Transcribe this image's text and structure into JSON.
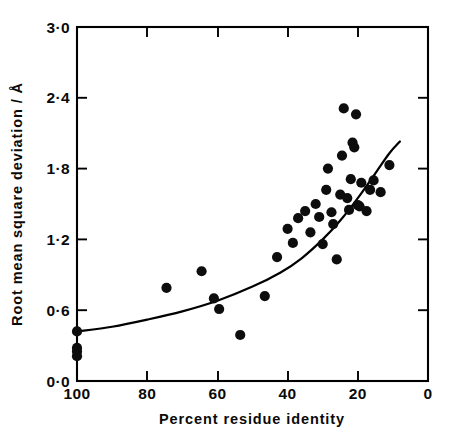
{
  "figure": {
    "background_color": "#ffffff",
    "ink_color": "#000000",
    "point_color": "#0d0d0d"
  },
  "chart_data": {
    "type": "scatter",
    "title": "",
    "xlabel": "Percent residue identity",
    "ylabel": "Root mean square deviation / Å",
    "xlim": [
      100,
      0
    ],
    "ylim": [
      0.0,
      3.0
    ],
    "x_reversed": true,
    "grid": false,
    "legend": null,
    "xticks": [
      100,
      80,
      60,
      40,
      20,
      0
    ],
    "xtick_labels": [
      "100",
      "80",
      "60",
      "40",
      "20",
      "0"
    ],
    "yticks": [
      0.0,
      0.6,
      1.2,
      1.8,
      2.4,
      3.0
    ],
    "ytick_labels": [
      "0·0",
      "0·6",
      "1·2",
      "1·8",
      "2·4",
      "3·0"
    ],
    "points": [
      [
        100.0,
        0.42
      ],
      [
        100.0,
        0.28
      ],
      [
        100.0,
        0.25
      ],
      [
        100.0,
        0.21
      ],
      [
        74.5,
        0.79
      ],
      [
        64.5,
        0.93
      ],
      [
        61.0,
        0.7
      ],
      [
        59.5,
        0.61
      ],
      [
        53.5,
        0.39
      ],
      [
        46.5,
        0.72
      ],
      [
        43.0,
        1.05
      ],
      [
        40.0,
        1.29
      ],
      [
        38.5,
        1.17
      ],
      [
        37.0,
        1.38
      ],
      [
        35.0,
        1.44
      ],
      [
        33.5,
        1.26
      ],
      [
        32.0,
        1.5
      ],
      [
        31.0,
        1.39
      ],
      [
        30.0,
        1.16
      ],
      [
        29.0,
        1.62
      ],
      [
        28.5,
        1.8
      ],
      [
        27.5,
        1.43
      ],
      [
        27.0,
        1.33
      ],
      [
        26.0,
        1.03
      ],
      [
        25.0,
        1.58
      ],
      [
        24.5,
        1.91
      ],
      [
        24.0,
        2.31
      ],
      [
        23.0,
        1.55
      ],
      [
        22.5,
        1.45
      ],
      [
        22.0,
        1.71
      ],
      [
        21.5,
        2.02
      ],
      [
        21.0,
        1.98
      ],
      [
        20.5,
        2.26
      ],
      [
        20.0,
        1.49
      ],
      [
        19.5,
        1.48
      ],
      [
        19.0,
        1.68
      ],
      [
        17.5,
        1.44
      ],
      [
        16.5,
        1.62
      ],
      [
        15.5,
        1.7
      ],
      [
        13.5,
        1.6
      ],
      [
        11.0,
        1.83
      ]
    ],
    "fit_curve": {
      "description": "smooth monotonic fitted trend line",
      "x": [
        100,
        90,
        80,
        70,
        60,
        50,
        42,
        36,
        30,
        25,
        20,
        15,
        11,
        8
      ],
      "y": [
        0.42,
        0.46,
        0.52,
        0.59,
        0.68,
        0.8,
        0.92,
        1.04,
        1.2,
        1.36,
        1.55,
        1.76,
        1.93,
        2.03
      ]
    }
  }
}
